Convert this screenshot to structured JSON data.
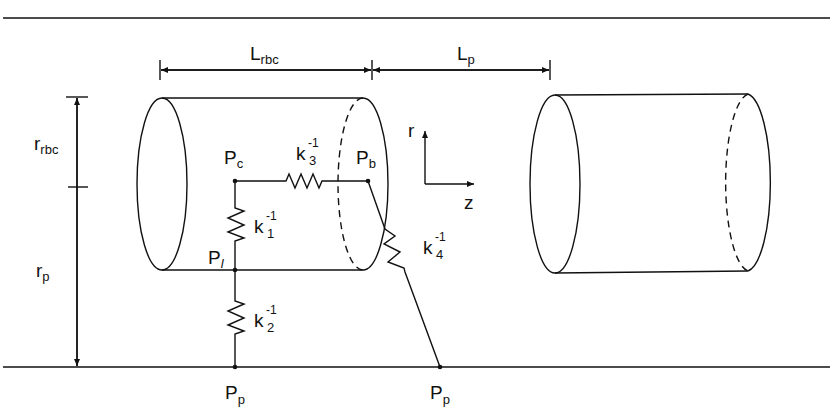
{
  "figure": {
    "dimensions": {
      "L_rbc": {
        "main": "L",
        "sub": "rbc"
      },
      "L_p": {
        "main": "L",
        "sub": "p"
      },
      "r_rbc": {
        "main": "r",
        "sub": "rbc"
      },
      "r_p": {
        "main": "r",
        "sub": "p"
      }
    },
    "axes": {
      "r": "r",
      "z": "z"
    },
    "nodes": {
      "Pc": {
        "main": "P",
        "sub": "c"
      },
      "Pb": {
        "main": "P",
        "sub": "b"
      },
      "Pl": {
        "main": "P",
        "sub": "l"
      },
      "Pp1": {
        "main": "P",
        "sub": "p"
      },
      "Pp2": {
        "main": "P",
        "sub": "p"
      }
    },
    "resistors": {
      "k1": {
        "main": "k",
        "sub": "1",
        "sup": "-1"
      },
      "k2": {
        "main": "k",
        "sub": "2",
        "sup": "-1"
      },
      "k3": {
        "main": "k",
        "sub": "3",
        "sup": "-1"
      },
      "k4": {
        "main": "k",
        "sub": "4",
        "sup": "-1"
      }
    }
  }
}
